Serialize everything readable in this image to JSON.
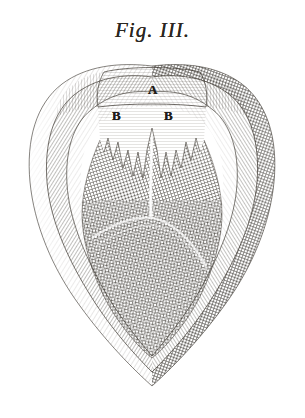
{
  "plate": {
    "title": "Fig. III.",
    "medium": "copper-plate engraving",
    "background_color": "#ffffff",
    "ink_color": "#2b2722",
    "width": 305,
    "height": 418
  },
  "labels": [
    {
      "text": "A",
      "x": 148,
      "y": 82,
      "name": "label-a"
    },
    {
      "text": "B",
      "x": 112,
      "y": 108,
      "name": "label-b-left"
    },
    {
      "text": "B",
      "x": 164,
      "y": 108,
      "name": "label-b-right"
    }
  ],
  "figure": {
    "outline_shape": "heart",
    "bounds": {
      "left": 26,
      "top": 62,
      "right": 278,
      "bottom": 388
    },
    "layers": [
      {
        "name": "outer-rim-left",
        "tone": "light",
        "hatch": "diagonal-fine"
      },
      {
        "name": "outer-rim-right",
        "tone": "dark",
        "hatch": "cross-hatch-dense"
      },
      {
        "name": "inner-wall-left",
        "tone": "mid-light",
        "hatch": "diagonal-medium"
      },
      {
        "name": "inner-wall-right",
        "tone": "mid",
        "hatch": "diagonal-medium"
      },
      {
        "name": "cavity-core",
        "tone": "dark",
        "hatch": "cross-hatch"
      }
    ],
    "features": [
      {
        "name": "upper-band-a",
        "description": "broad pale horizontally-lined band at top, labelled A"
      },
      {
        "name": "shoulder-lobe-left",
        "description": "rounded hatched lobe at upper left"
      },
      {
        "name": "shoulder-lobe-right",
        "description": "rounded hatched lobe at upper right"
      },
      {
        "name": "serrated-membrane",
        "description": "jagged saw-tooth fringe beneath band A, flanking labels B"
      },
      {
        "name": "central-seam",
        "description": "pale vertical seam descending through the dark core"
      },
      {
        "name": "transverse-fold",
        "description": "pale curved line crossing the core"
      },
      {
        "name": "apex-tip",
        "description": "pointed base where the layers converge"
      }
    ]
  }
}
